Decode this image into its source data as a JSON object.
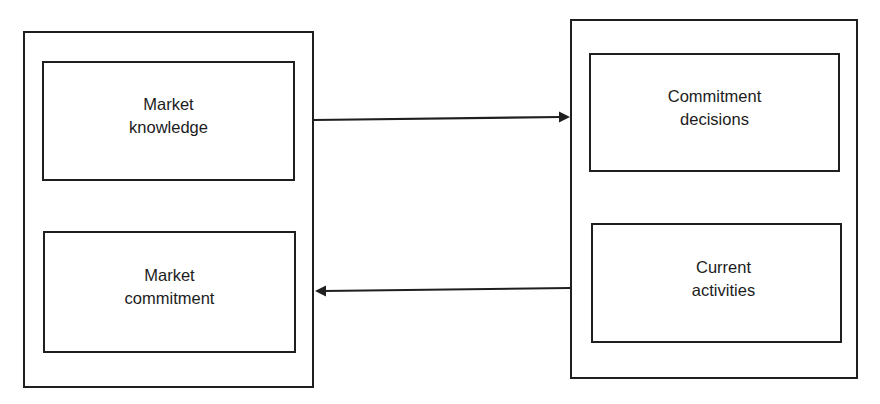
{
  "diagram": {
    "left_group": {
      "top_box": {
        "line1": "Market",
        "line2": "knowledge"
      },
      "bottom_box": {
        "line1": "Market",
        "line2": "commitment"
      }
    },
    "right_group": {
      "top_box": {
        "line1": "Commitment",
        "line2": "decisions"
      },
      "bottom_box": {
        "line1": "Current",
        "line2": "activities"
      }
    },
    "arrows": [
      {
        "from": "left_group",
        "to": "right_group",
        "direction": "right"
      },
      {
        "from": "right_group",
        "to": "left_group",
        "direction": "left"
      }
    ],
    "colors": {
      "stroke": "#1f1f1f",
      "background": "#ffffff",
      "text": "#1c1c1c"
    }
  }
}
